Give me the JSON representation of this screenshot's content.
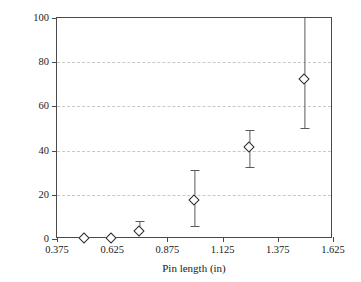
{
  "chart_data": {
    "type": "scatter",
    "title": "",
    "xlabel": "Pin length (in)",
    "ylabel": "Circumferential Cracking %",
    "xlim": [
      0.375,
      1.625
    ],
    "ylim": [
      0,
      100
    ],
    "xticks": [
      "0.375",
      "0.625",
      "0.875",
      "1.125",
      "1.375",
      "1.625"
    ],
    "xtick_values": [
      0.375,
      0.625,
      0.875,
      1.125,
      1.375,
      1.625
    ],
    "yticks": [
      "0",
      "20",
      "40",
      "60",
      "80",
      "100"
    ],
    "ytick_values": [
      0,
      20,
      40,
      60,
      80,
      100
    ],
    "grid": "horizontal-dashed",
    "legend": "none",
    "marker": "open-diamond",
    "marker_color": "#2a2a2a",
    "marker_fill": "#ffffff",
    "errorbar_color": "#5a5a5a",
    "gridline_color": "#c8c8c8",
    "axis_color": "#4a4a4a",
    "x": [
      0.5,
      0.625,
      0.75,
      1.0,
      1.25,
      1.5
    ],
    "y": [
      0,
      0,
      3,
      17,
      41,
      72
    ],
    "yerr_lower": [
      0,
      0,
      0,
      11,
      8.5,
      22
    ],
    "yerr_upper": [
      0,
      0,
      5,
      14,
      8.5,
      28
    ],
    "points": [
      {
        "x": 0.5,
        "y": 0,
        "err_low": 0,
        "err_high": 0
      },
      {
        "x": 0.625,
        "y": 0,
        "err_low": 0,
        "err_high": 0
      },
      {
        "x": 0.75,
        "y": 3,
        "err_low": 0,
        "err_high": 5
      },
      {
        "x": 1.0,
        "y": 17,
        "err_low": 11,
        "err_high": 14
      },
      {
        "x": 1.25,
        "y": 41,
        "err_low": 8.5,
        "err_high": 8.5
      },
      {
        "x": 1.5,
        "y": 72,
        "err_low": 22,
        "err_high": 28
      }
    ]
  }
}
